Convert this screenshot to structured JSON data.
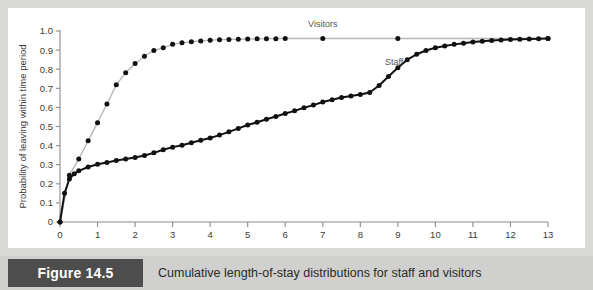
{
  "figure": {
    "badge_label": "Figure 14.5",
    "caption": "Cumulative length-of-stay distributions for staff and visitors"
  },
  "colors": {
    "page_background": "#d9d9d7",
    "panel_background": "#ffffff",
    "caption_band": "#d0d0ce",
    "badge_background": "#4d4d4d",
    "badge_text": "#ffffff",
    "axis_line": "#8c8c8c",
    "staff_line": "#111111",
    "visitors_line": "#b8b8b8",
    "marker": "#111111",
    "label_text": "#555555"
  },
  "chart_data": {
    "type": "line",
    "title": "",
    "xlabel": "",
    "ylabel": "Probability of leaving within time period",
    "xlim": [
      0,
      13
    ],
    "ylim": [
      0,
      1.0
    ],
    "grid": false,
    "legend_position": "inline-annotations",
    "xticks": [
      0,
      1,
      2,
      3,
      4,
      5,
      6,
      7,
      8,
      9,
      10,
      11,
      12,
      13
    ],
    "xtick_labels": [
      "0",
      "1",
      "2",
      "3",
      "4",
      "5",
      "6",
      "7",
      "8",
      "9",
      "10",
      "11",
      "12",
      "13"
    ],
    "yticks": [
      0,
      0.1,
      0.2,
      0.3,
      0.4,
      0.5,
      0.6,
      0.7,
      0.8,
      0.9,
      1.0
    ],
    "ytick_labels": [
      "0",
      "0.1",
      "0.2",
      "0.3",
      "0.4",
      "0.5",
      "0.6",
      "0.7",
      "0.8",
      "0.9",
      "1.0"
    ],
    "annotations": [
      {
        "text": "Visitors",
        "x": 7.0,
        "y": 1.0
      },
      {
        "text": "Staff",
        "x": 8.9,
        "y": 0.8
      }
    ],
    "series": [
      {
        "name": "Visitors",
        "line_color": "#b8b8b8",
        "marker_color": "#111111",
        "points": [
          [
            0.0,
            0.0
          ],
          [
            0.25,
            0.245
          ],
          [
            0.5,
            0.33
          ],
          [
            0.75,
            0.425
          ],
          [
            1.0,
            0.52
          ],
          [
            1.25,
            0.618
          ],
          [
            1.5,
            0.718
          ],
          [
            1.75,
            0.782
          ],
          [
            2.0,
            0.83
          ],
          [
            2.25,
            0.868
          ],
          [
            2.5,
            0.898
          ],
          [
            2.75,
            0.912
          ],
          [
            3.0,
            0.93
          ],
          [
            3.25,
            0.938
          ],
          [
            3.5,
            0.944
          ],
          [
            3.75,
            0.948
          ],
          [
            4.0,
            0.952
          ],
          [
            4.25,
            0.954
          ],
          [
            4.5,
            0.956
          ],
          [
            4.75,
            0.957
          ],
          [
            5.0,
            0.958
          ],
          [
            5.25,
            0.959
          ],
          [
            5.5,
            0.96
          ],
          [
            5.75,
            0.96
          ],
          [
            6.0,
            0.961
          ],
          [
            7.0,
            0.961
          ],
          [
            9.0,
            0.961
          ],
          [
            13.0,
            0.961
          ]
        ]
      },
      {
        "name": "Staff",
        "line_color": "#111111",
        "marker_color": "#111111",
        "points": [
          [
            0.0,
            0.0
          ],
          [
            0.12,
            0.15
          ],
          [
            0.25,
            0.225
          ],
          [
            0.38,
            0.252
          ],
          [
            0.5,
            0.268
          ],
          [
            0.75,
            0.288
          ],
          [
            1.0,
            0.302
          ],
          [
            1.25,
            0.312
          ],
          [
            1.5,
            0.322
          ],
          [
            1.75,
            0.33
          ],
          [
            2.0,
            0.338
          ],
          [
            2.25,
            0.348
          ],
          [
            2.5,
            0.362
          ],
          [
            2.75,
            0.378
          ],
          [
            3.0,
            0.392
          ],
          [
            3.25,
            0.402
          ],
          [
            3.5,
            0.415
          ],
          [
            3.75,
            0.428
          ],
          [
            4.0,
            0.44
          ],
          [
            4.25,
            0.455
          ],
          [
            4.5,
            0.472
          ],
          [
            4.75,
            0.49
          ],
          [
            5.0,
            0.508
          ],
          [
            5.25,
            0.522
          ],
          [
            5.5,
            0.538
          ],
          [
            5.75,
            0.552
          ],
          [
            6.0,
            0.568
          ],
          [
            6.25,
            0.582
          ],
          [
            6.5,
            0.598
          ],
          [
            6.75,
            0.612
          ],
          [
            7.0,
            0.628
          ],
          [
            7.25,
            0.64
          ],
          [
            7.5,
            0.652
          ],
          [
            7.75,
            0.66
          ],
          [
            8.0,
            0.668
          ],
          [
            8.25,
            0.678
          ],
          [
            8.5,
            0.715
          ],
          [
            8.75,
            0.762
          ],
          [
            9.0,
            0.808
          ],
          [
            9.25,
            0.85
          ],
          [
            9.5,
            0.878
          ],
          [
            9.75,
            0.898
          ],
          [
            10.0,
            0.912
          ],
          [
            10.25,
            0.922
          ],
          [
            10.5,
            0.93
          ],
          [
            10.75,
            0.936
          ],
          [
            11.0,
            0.942
          ],
          [
            11.25,
            0.946
          ],
          [
            11.5,
            0.95
          ],
          [
            11.75,
            0.953
          ],
          [
            12.0,
            0.955
          ],
          [
            12.25,
            0.957
          ],
          [
            12.5,
            0.958
          ],
          [
            12.75,
            0.96
          ],
          [
            13.0,
            0.961
          ]
        ]
      }
    ]
  }
}
